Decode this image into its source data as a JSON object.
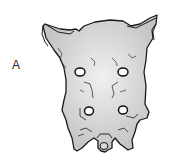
{
  "figure": {
    "label": "A",
    "colors": {
      "fill": "#c9c9c9",
      "highlight": "#ececec",
      "outline": "#1a1a1a",
      "background": "#ffffff"
    }
  }
}
